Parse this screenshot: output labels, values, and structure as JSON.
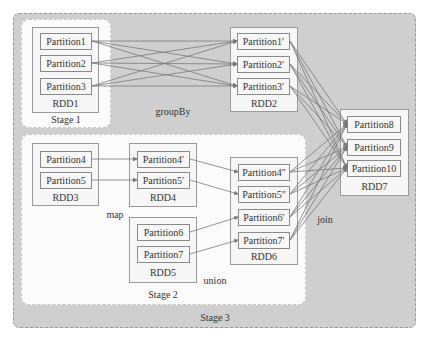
{
  "diagram": {
    "stages": {
      "stage1": "Stage 1",
      "stage2": "Stage 2",
      "stage3": "Stage 3"
    },
    "operations": {
      "groupBy": "groupBy",
      "map": "map",
      "union": "union",
      "join": "join"
    },
    "rdds": {
      "rdd1": {
        "label": "RDD1",
        "partitions": [
          "Partition1",
          "Partition2",
          "Partition3"
        ]
      },
      "rdd2": {
        "label": "RDD2",
        "partitions": [
          "Partition1′",
          "Partition2′",
          "Partition3′"
        ]
      },
      "rdd3": {
        "label": "RDD3",
        "partitions": [
          "Partition4",
          "Partition5"
        ]
      },
      "rdd4": {
        "label": "RDD4",
        "partitions": [
          "Partition4′",
          "Partition5′"
        ]
      },
      "rdd5": {
        "label": "RDD5",
        "partitions": [
          "Partition6",
          "Partition7"
        ]
      },
      "rdd6": {
        "label": "RDD6",
        "partitions": [
          "Partition4″",
          "Partition5″",
          "Partition6′",
          "Partition7′"
        ]
      },
      "rdd7": {
        "label": "RDD7",
        "partitions": [
          "Partition8",
          "Partition9",
          "Partition10"
        ]
      }
    },
    "edges": [
      {
        "from": "Partition1",
        "to": [
          "Partition1′",
          "Partition2′",
          "Partition3′"
        ],
        "op": "groupBy"
      },
      {
        "from": "Partition2",
        "to": [
          "Partition1′",
          "Partition2′",
          "Partition3′"
        ],
        "op": "groupBy"
      },
      {
        "from": "Partition3",
        "to": [
          "Partition1′",
          "Partition2′",
          "Partition3′"
        ],
        "op": "groupBy"
      },
      {
        "from": "Partition4",
        "to": [
          "Partition4′"
        ],
        "op": "map"
      },
      {
        "from": "Partition5",
        "to": [
          "Partition5′"
        ],
        "op": "map"
      },
      {
        "from": "Partition4′",
        "to": [
          "Partition4″"
        ],
        "op": "union"
      },
      {
        "from": "Partition5′",
        "to": [
          "Partition5″"
        ],
        "op": "union"
      },
      {
        "from": "Partition6",
        "to": [
          "Partition6′"
        ],
        "op": "union"
      },
      {
        "from": "Partition7",
        "to": [
          "Partition7′"
        ],
        "op": "union"
      },
      {
        "from": "Partition1′",
        "to": [
          "Partition8",
          "Partition9",
          "Partition10"
        ],
        "op": "join"
      },
      {
        "from": "Partition2′",
        "to": [
          "Partition8",
          "Partition9",
          "Partition10"
        ],
        "op": "join"
      },
      {
        "from": "Partition3′",
        "to": [
          "Partition8",
          "Partition9",
          "Partition10"
        ],
        "op": "join"
      },
      {
        "from": "Partition4″",
        "to": [
          "Partition8",
          "Partition9",
          "Partition10"
        ],
        "op": "join"
      },
      {
        "from": "Partition5″",
        "to": [
          "Partition8",
          "Partition9",
          "Partition10"
        ],
        "op": "join"
      },
      {
        "from": "Partition6′",
        "to": [
          "Partition8",
          "Partition9",
          "Partition10"
        ],
        "op": "join"
      },
      {
        "from": "Partition7′",
        "to": [
          "Partition8",
          "Partition9",
          "Partition10"
        ],
        "op": "join"
      }
    ],
    "colors": {
      "stage3_bg": "#cfcfcf",
      "stage_white_bg": "#fbfbfb",
      "edge": "#7a7a7a",
      "box_border": "#8a8a8a"
    }
  }
}
